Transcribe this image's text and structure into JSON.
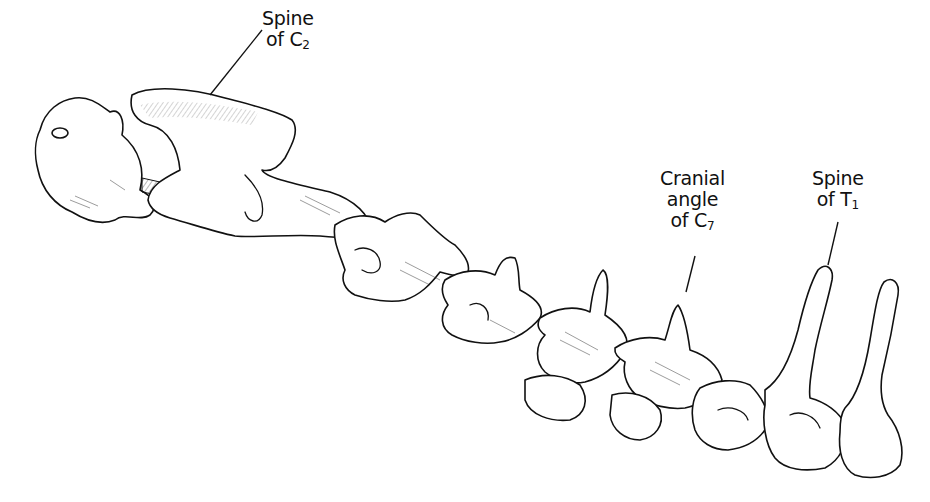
{
  "figure": {
    "labels": [
      {
        "id": "spine-c2",
        "line1": "Spine",
        "line2_prefix": "of C",
        "line2_sub": "2"
      },
      {
        "id": "cranial-angle-c7",
        "line1": "Cranial",
        "line1b": "angle",
        "line2_prefix": "of C",
        "line2_sub": "7"
      },
      {
        "id": "spine-t1",
        "line1": "Spine",
        "line2_prefix": "of T",
        "line2_sub": "1"
      }
    ],
    "colors": {
      "ink": "#111111",
      "background": "#ffffff"
    }
  }
}
